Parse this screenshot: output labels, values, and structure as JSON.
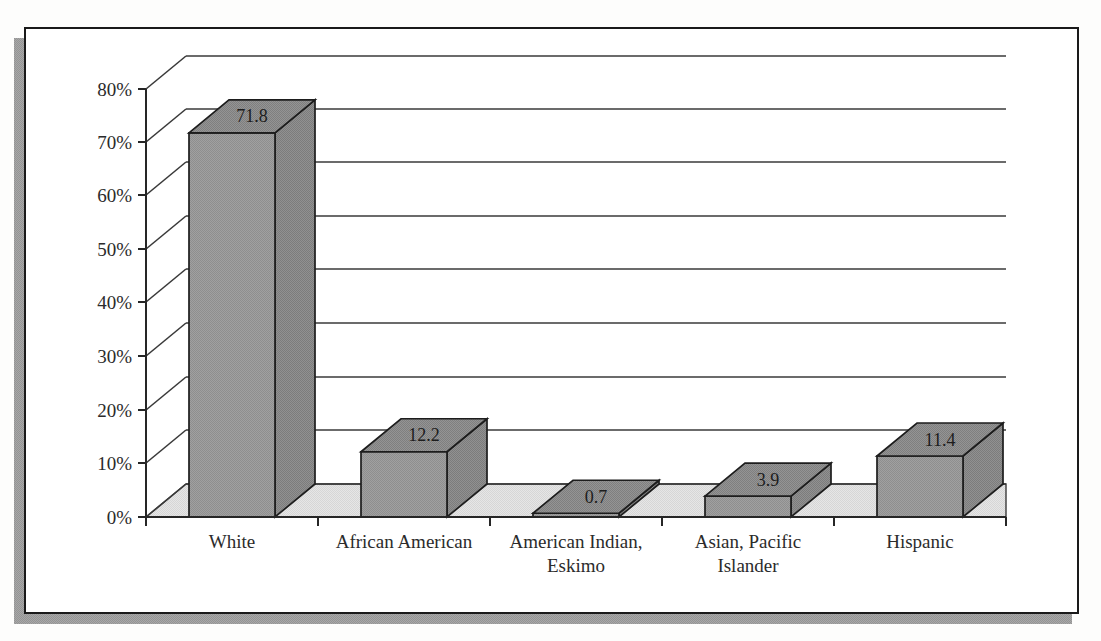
{
  "chart_data": {
    "type": "bar",
    "title": "",
    "subtitle": "",
    "xlabel": "",
    "ylabel": "",
    "categories": [
      "White",
      "African American",
      "American Indian, Eskimo",
      "Asian, Pacific Islander",
      "Hispanic"
    ],
    "category_lines": [
      [
        "White"
      ],
      [
        "African American"
      ],
      [
        "American Indian,",
        "Eskimo"
      ],
      [
        "Asian, Pacific",
        "Islander"
      ],
      [
        "Hispanic"
      ]
    ],
    "values": [
      71.8,
      12.2,
      0.7,
      3.9,
      11.4
    ],
    "value_labels": [
      "71.8",
      "12.2",
      "0.7",
      "3.9",
      "11.4"
    ],
    "ylim": [
      0,
      80
    ],
    "ytick_values": [
      0,
      10,
      20,
      30,
      40,
      50,
      60,
      70,
      80
    ],
    "ytick_labels": [
      "0%",
      "10%",
      "20%",
      "30%",
      "40%",
      "50%",
      "60%",
      "70%",
      "80%"
    ],
    "grid": true,
    "grid_axis": "y",
    "legend": false,
    "legend_position": "none",
    "style": "3d-perspective-bars",
    "series": [
      {
        "name": "Percent",
        "values": [
          71.8,
          12.2,
          0.7,
          3.9,
          11.4
        ]
      }
    ]
  },
  "colors": {
    "bar_front": "#9b9b9b",
    "bar_top": "#8c8c8c",
    "bar_side": "#8a8a8a",
    "floor": "#e0e0e0",
    "wall": "#ffffff",
    "grid_line": "#3a3a3a",
    "axis_line": "#262626",
    "border": "#1a1a1a",
    "shadow": "#9d9d9d",
    "text": "#2b2b2b",
    "page_background": "#fdfdfc"
  },
  "frame": {
    "has_outer_border": true,
    "has_drop_shadow": true
  },
  "accessibility": {
    "chart_role": "3D column chart of population percentages by race and ethnicity"
  }
}
